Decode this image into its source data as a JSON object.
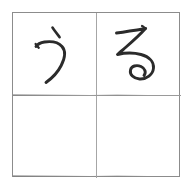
{
  "worksheet": {
    "type": "hiragana-handwriting-practice-grid",
    "rows": 2,
    "columns": 2,
    "background_color": "#ffffff",
    "border_color": "#8c8c8c",
    "guide_line_color": "#a6a6a6",
    "ink_color": "#2b2b2b"
  },
  "cells": [
    {
      "position": "top-left",
      "character": "う",
      "romaji": "u",
      "script": "hiragana",
      "filled": true,
      "stroke_count": 2
    },
    {
      "position": "top-right",
      "character": "る",
      "romaji": "ru",
      "script": "hiragana",
      "filled": true,
      "stroke_count": 1
    },
    {
      "position": "bottom-left",
      "character": "",
      "romaji": "",
      "script": "",
      "filled": false,
      "stroke_count": 0
    },
    {
      "position": "bottom-right",
      "character": "",
      "romaji": "",
      "script": "",
      "filled": false,
      "stroke_count": 0
    }
  ]
}
